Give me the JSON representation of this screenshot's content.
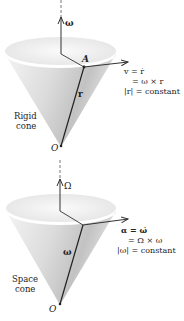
{
  "diagram": {
    "top_panel": {
      "axis_vector_label": "ω",
      "point_label": "A",
      "position_vector_label": "r",
      "origin_label": "O",
      "cone_label_line1": "Rigid",
      "cone_label_line2": "cone",
      "equation_line1": "v = ṙ",
      "equation_line2": "= ω × r",
      "equation_line3": "|r| = constant"
    },
    "bottom_panel": {
      "axis_vector_label": "Ω",
      "position_vector_label": "ω",
      "origin_label": "O",
      "cone_label_line1": "Space",
      "cone_label_line2": "cone",
      "equation_line1": "α = ω̇",
      "equation_line2": "= Ω × ω",
      "equation_line3": "|ω| = constant"
    }
  },
  "colors": {
    "line": "#222222",
    "cone_light": "#f2f2f2",
    "cone_dark": "#b8b8b8"
  }
}
